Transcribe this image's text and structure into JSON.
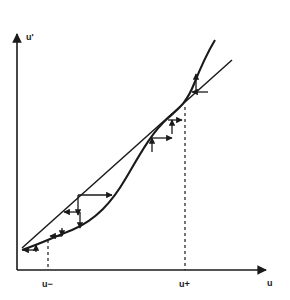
{
  "figure": {
    "title": "",
    "background_color": "#ffffff",
    "ink_color": "#1a1a1a"
  },
  "axes": {
    "y_axis_label": "u'",
    "x_axis_label": "u",
    "origin": {
      "x": 17,
      "y": 270
    },
    "x_axis_end": {
      "x": 272,
      "y": 270
    },
    "y_axis_top": {
      "x": 17,
      "y": 30
    }
  },
  "fixed_points": [
    {
      "name": "u-minus",
      "label": "u−",
      "x_px": 48,
      "y_px": 240,
      "tick_label_x": 44,
      "tick_label_y": 284,
      "stability": "stable"
    },
    {
      "name": "u-plus",
      "label": "u+",
      "x_px": 185,
      "y_px": 107,
      "tick_label_x": 180,
      "tick_label_y": 284,
      "stability": "unstable"
    }
  ],
  "guides": {
    "dashed_left": {
      "x": 48,
      "y_top": 240,
      "y_bottom": 270
    },
    "dashed_right": {
      "x": 185,
      "y_top": 107,
      "y_bottom": 270
    }
  },
  "curves": [
    {
      "name": "diagonal-identity-line",
      "kind": "line",
      "description": "straight line u' = u (identity / diagonal)",
      "path": "M 22,248 L 232,60"
    },
    {
      "name": "response-curve",
      "kind": "sigmoid",
      "description": "S-shaped response curve crossing the diagonal at u- and u+",
      "path": "M 22,250 C 40,244 52,238 72,230 C 96,220 112,202 126,178 C 140,154 152,132 168,118 C 178,109 186,104 194,84 C 202,64 209,50 215,40"
    }
  ],
  "cobweb": {
    "description": "staircase arrows showing convergence toward u- and divergence away from u+",
    "segments": [
      {
        "name": "step-h-1",
        "type": "horizontal",
        "x1": 22,
        "y1": 250,
        "x2": 36,
        "y2": 250,
        "arrow": "left"
      },
      {
        "name": "step-v-1",
        "type": "vertical",
        "x1": 36,
        "y1": 250,
        "x2": 36,
        "y2": 245,
        "arrow": "up"
      },
      {
        "name": "step-v-2",
        "type": "vertical",
        "x1": 62,
        "y1": 229,
        "x2": 62,
        "y2": 236,
        "arrow": "down"
      },
      {
        "name": "step-h-2",
        "type": "horizontal",
        "x1": 62,
        "y1": 236,
        "x2": 78,
        "y2": 236,
        "arrow": "right"
      },
      {
        "name": "step-v-3",
        "type": "vertical",
        "x1": 80,
        "y1": 208,
        "x2": 80,
        "y2": 227,
        "arrow": "down"
      },
      {
        "name": "step-h-3",
        "type": "horizontal",
        "x1": 80,
        "y1": 208,
        "x2": 112,
        "y2": 208,
        "arrow": "right"
      },
      {
        "name": "step-v-4",
        "type": "vertical",
        "x1": 152,
        "y1": 152,
        "x2": 152,
        "y2": 140,
        "arrow": "down"
      },
      {
        "name": "step-h-4",
        "type": "horizontal",
        "x1": 152,
        "y1": 140,
        "x2": 172,
        "y2": 140,
        "arrow": "right"
      },
      {
        "name": "step-v-5",
        "type": "vertical",
        "x1": 172,
        "y1": 122,
        "x2": 172,
        "y2": 138,
        "arrow": "up"
      },
      {
        "name": "step-h-5",
        "type": "horizontal",
        "x1": 172,
        "y1": 122,
        "x2": 180,
        "y2": 122,
        "arrow": "right"
      },
      {
        "name": "step-v-6",
        "type": "vertical",
        "x1": 196,
        "y1": 74,
        "x2": 196,
        "y2": 90,
        "arrow": "up"
      },
      {
        "name": "step-h-6",
        "type": "horizontal",
        "x1": 196,
        "y1": 90,
        "x2": 206,
        "y2": 90,
        "arrow": "left"
      }
    ]
  }
}
